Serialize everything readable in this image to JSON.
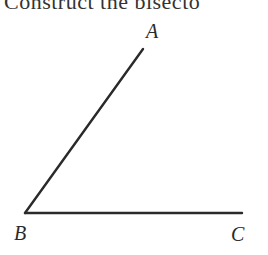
{
  "title": "Construct the bisecto",
  "diagram": {
    "type": "angle",
    "points": {
      "A": {
        "label": "A",
        "x": 143,
        "y": 49
      },
      "B": {
        "label": "B",
        "x": 25,
        "y": 213
      },
      "C": {
        "label": "C",
        "x": 242,
        "y": 213
      }
    },
    "segments": [
      [
        "B",
        "A"
      ],
      [
        "B",
        "C"
      ]
    ],
    "line_color": "#2a2a2a"
  }
}
